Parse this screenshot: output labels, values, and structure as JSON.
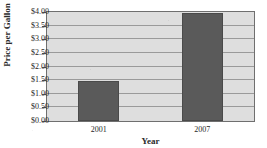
{
  "chart_data": {
    "type": "bar",
    "title": "Gasoline Prices",
    "title_truncated": true,
    "categories": [
      "2001",
      "2007"
    ],
    "values": [
      1.46,
      3.98
    ],
    "xlabel": "Year",
    "ylabel": "Price per Gallon",
    "ylim": [
      0,
      4
    ],
    "ytick_step": 0.5,
    "ytick_labels": [
      "$0.00",
      "$0.50",
      "$1.00",
      "$1.50",
      "$2.00",
      "$2.50",
      "$3.00",
      "$3.50",
      "$4.00"
    ],
    "ytick_values": [
      0,
      0.5,
      1,
      1.5,
      2,
      2.5,
      3,
      3.5,
      4
    ],
    "grid": true,
    "grid_axis": "y",
    "legend": false,
    "legend_position": "none",
    "orientation": "vertical",
    "series": [
      {
        "name": "Price per Gallon",
        "values": [
          1.46,
          3.98
        ]
      }
    ]
  },
  "style": {
    "bar_color": "#5a5a5a",
    "bar_edge_color": "#4a4a4a",
    "plot_background": "#dedede",
    "page_background": "#ffffff",
    "gridline_color": "#9a9a9a",
    "axis_color": "#6f6f6f",
    "text_color": "#1f1f1f"
  }
}
